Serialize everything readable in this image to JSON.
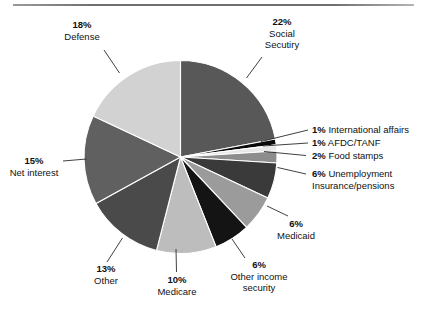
{
  "chart_data": {
    "type": "pie",
    "title": "",
    "subtitle": "",
    "xlabel": "",
    "ylabel": "",
    "legend_position": "none",
    "grid": false,
    "units": "percent",
    "total": 100,
    "start_angle_deg": 0,
    "direction": "clockwise",
    "categories": [
      "Social Secutiry",
      "International affairs",
      "AFDC/TANF",
      "Food stamps",
      "Unemployment Insurance/pensions",
      "Medicaid",
      "Other income security",
      "Medicare",
      "Other",
      "Net interest",
      "Defense"
    ],
    "values": [
      22,
      1,
      1,
      2,
      6,
      6,
      6,
      10,
      13,
      15,
      18
    ],
    "colors": [
      "#585858",
      "#0a0a0a",
      "#e8e8e8",
      "#8d8d8d",
      "#3a3a3a",
      "#9b9b9b",
      "#141414",
      "#bdbdbd",
      "#4a4a4a",
      "#606060",
      "#d2d2d2"
    ],
    "slices": [
      {
        "label": "Social Secutiry",
        "value": 22,
        "display": "22%",
        "color": "#585858"
      },
      {
        "label": "International affairs",
        "value": 1,
        "display": "1%",
        "color": "#0a0a0a"
      },
      {
        "label": "AFDC/TANF",
        "value": 1,
        "display": "1%",
        "color": "#e8e8e8"
      },
      {
        "label": "Food stamps",
        "value": 2,
        "display": "2%",
        "color": "#8d8d8d"
      },
      {
        "label": "Unemployment Insurance/pensions",
        "value": 6,
        "display": "6%",
        "color": "#3a3a3a"
      },
      {
        "label": "Medicaid",
        "value": 6,
        "display": "6%",
        "color": "#9b9b9b"
      },
      {
        "label": "Other income security",
        "value": 6,
        "display": "6%",
        "color": "#141414"
      },
      {
        "label": "Medicare",
        "value": 10,
        "display": "10%",
        "color": "#bdbdbd"
      },
      {
        "label": "Other",
        "value": 13,
        "display": "13%",
        "color": "#4a4a4a"
      },
      {
        "label": "Net interest",
        "value": 15,
        "display": "15%",
        "color": "#606060"
      },
      {
        "label": "Defense",
        "value": 18,
        "display": "18%",
        "color": "#d2d2d2"
      }
    ]
  },
  "labels": {
    "social_security": {
      "pct": "22%",
      "l1": "Social",
      "l2": "Secutiry"
    },
    "international_affairs": {
      "pct": "1%",
      "l1": "International affairs"
    },
    "afdc_tanf": {
      "pct": "1%",
      "l1": "AFDC/TANF"
    },
    "food_stamps": {
      "pct": "2%",
      "l1": "Food stamps"
    },
    "unemployment": {
      "pct": "6%",
      "l1": "Unemployment",
      "l2": "Insurance/pensions"
    },
    "medicaid": {
      "pct": "6%",
      "l1": "Medicaid"
    },
    "other_income_security": {
      "pct": "6%",
      "l1": "Other income",
      "l2": "security"
    },
    "medicare": {
      "pct": "10%",
      "l1": "Medicare"
    },
    "other": {
      "pct": "13%",
      "l1": "Other"
    },
    "net_interest": {
      "pct": "15%",
      "l1": "Net interest"
    },
    "defense": {
      "pct": "18%",
      "l1": "Defense"
    }
  },
  "style": {
    "slice_edge_color": "#ffffff",
    "leader_line_color": "#2b2b2b",
    "background": "#ffffff",
    "rule_color": "#6f6f6f"
  }
}
